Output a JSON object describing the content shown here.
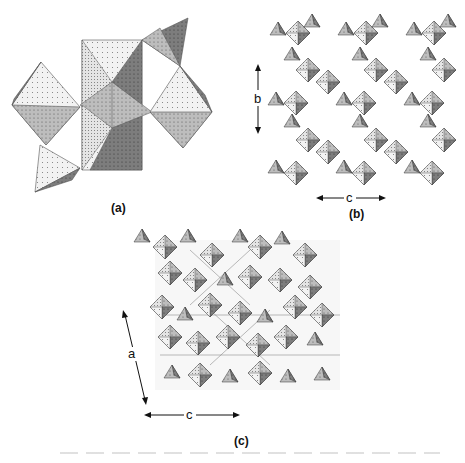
{
  "figure": {
    "panels": [
      {
        "id": "a",
        "label": "(a)",
        "axes": []
      },
      {
        "id": "b",
        "label": "(b)",
        "axes": [
          {
            "name": "b",
            "direction": "vertical"
          },
          {
            "name": "c",
            "direction": "horizontal"
          }
        ]
      },
      {
        "id": "c",
        "label": "(c)",
        "axes": [
          {
            "name": "a",
            "direction": "diagonal"
          },
          {
            "name": "c",
            "direction": "horizontal"
          }
        ]
      }
    ]
  },
  "colors": {
    "light": "#f4f4f4",
    "mid": "#b8b8b8",
    "dark": "#7a7a7a",
    "edge": "#333333"
  }
}
